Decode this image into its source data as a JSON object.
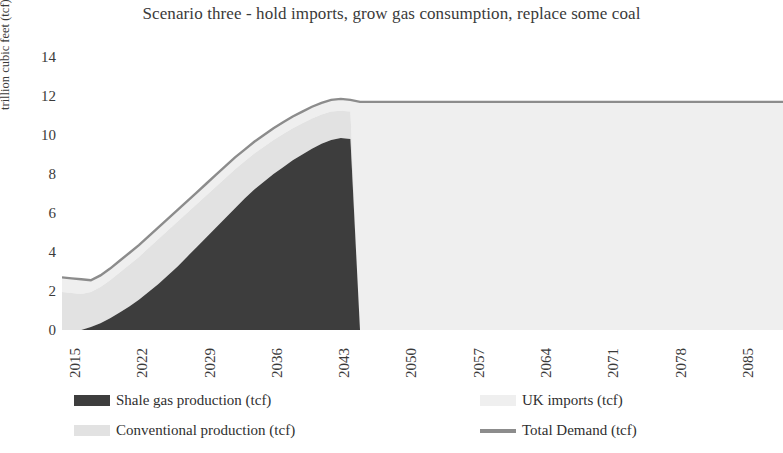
{
  "chart_data": {
    "type": "area",
    "title": "Scenario three - hold imports, grow gas consumption, replace some coal",
    "xlabel": "",
    "ylabel": "trillion cubic feet (tcf)",
    "ylim": [
      0,
      14
    ],
    "yticks": [
      0,
      2,
      4,
      6,
      8,
      10,
      12,
      14
    ],
    "xlim": [
      2015,
      2090
    ],
    "xticks": [
      2015,
      2022,
      2029,
      2036,
      2043,
      2050,
      2057,
      2064,
      2071,
      2078,
      2085
    ],
    "grid": false,
    "legend_position": "bottom",
    "stacked": true,
    "stack_order": [
      "Shale gas production (tcf)",
      "Conventional production (tcf)",
      "UK imports (tcf)"
    ],
    "colors": {
      "shale": "#3d3d3d",
      "conventional": "#e2e2e2",
      "imports": "#efefef",
      "demand_line": "#8c8c8c"
    },
    "x": [
      2015,
      2016,
      2017,
      2018,
      2019,
      2020,
      2021,
      2022,
      2023,
      2024,
      2025,
      2026,
      2027,
      2028,
      2029,
      2030,
      2031,
      2032,
      2033,
      2034,
      2035,
      2036,
      2037,
      2038,
      2039,
      2040,
      2041,
      2042,
      2043,
      2044,
      2045,
      2046,
      2047,
      2048,
      2049,
      2050,
      2055,
      2060,
      2065,
      2070,
      2075,
      2080,
      2085,
      2090
    ],
    "series": [
      {
        "name": "Shale gas production (tcf)",
        "color": "#3d3d3d",
        "values": [
          0,
          0,
          0,
          0.15,
          0.35,
          0.6,
          0.9,
          1.2,
          1.55,
          1.95,
          2.35,
          2.8,
          3.25,
          3.75,
          4.25,
          4.75,
          5.25,
          5.75,
          6.25,
          6.75,
          7.2,
          7.6,
          8.0,
          8.35,
          8.7,
          9.0,
          9.3,
          9.55,
          9.75,
          9.85,
          9.8,
          0,
          0,
          0,
          0,
          0,
          0,
          0,
          0,
          0,
          0,
          0,
          0,
          0
        ]
      },
      {
        "name": "Conventional production (tcf)",
        "color": "#e2e2e2",
        "values": [
          1.95,
          1.9,
          1.85,
          1.8,
          1.85,
          1.95,
          2.05,
          2.15,
          2.2,
          2.25,
          2.3,
          2.3,
          2.3,
          2.25,
          2.2,
          2.15,
          2.1,
          2.05,
          2.0,
          1.9,
          1.85,
          1.8,
          1.75,
          1.7,
          1.65,
          1.6,
          1.55,
          1.5,
          1.45,
          1.4,
          1.4,
          0,
          0,
          0,
          0,
          0,
          0,
          0,
          0,
          0,
          0,
          0,
          0,
          0
        ]
      },
      {
        "name": "UK imports (tcf)",
        "color": "#efefef",
        "values": [
          0.75,
          0.75,
          0.75,
          0.6,
          0.6,
          0.6,
          0.6,
          0.6,
          0.6,
          0.6,
          0.6,
          0.6,
          0.6,
          0.6,
          0.6,
          0.6,
          0.6,
          0.6,
          0.6,
          0.6,
          0.6,
          0.6,
          0.6,
          0.6,
          0.6,
          0.6,
          0.6,
          0.6,
          0.6,
          0.6,
          0.6,
          11.7,
          11.7,
          11.7,
          11.7,
          11.7,
          11.7,
          11.7,
          11.7,
          11.7,
          11.7,
          11.7,
          11.7,
          11.7
        ]
      },
      {
        "name": "Total Demand (tcf)",
        "color": "#8c8c8c",
        "type": "line",
        "values": [
          2.7,
          2.65,
          2.6,
          2.55,
          2.8,
          3.15,
          3.55,
          3.95,
          4.35,
          4.8,
          5.25,
          5.7,
          6.15,
          6.6,
          7.05,
          7.5,
          7.95,
          8.4,
          8.85,
          9.25,
          9.65,
          10.0,
          10.35,
          10.65,
          10.95,
          11.2,
          11.45,
          11.65,
          11.8,
          11.85,
          11.8,
          11.7,
          11.7,
          11.7,
          11.7,
          11.7,
          11.7,
          11.7,
          11.7,
          11.7,
          11.7,
          11.7,
          11.7,
          11.7
        ]
      }
    ]
  },
  "axis": {
    "y_title": "trillion cubic feet (tcf)",
    "y_tick_labels": [
      "14",
      "12",
      "10",
      "8",
      "6",
      "4",
      "2",
      "0"
    ],
    "x_tick_labels": [
      "2015",
      "2022",
      "2029",
      "2036",
      "2043",
      "2050",
      "2057",
      "2064",
      "2071",
      "2078",
      "2085"
    ]
  },
  "legend": {
    "items": [
      {
        "label": "Shale gas production (tcf)",
        "color": "#3d3d3d",
        "kind": "box"
      },
      {
        "label": "Conventional production (tcf)",
        "color": "#e2e2e2",
        "kind": "box"
      },
      {
        "label": "UK imports (tcf)",
        "color": "#efefef",
        "kind": "box"
      },
      {
        "label": "Total Demand (tcf)",
        "color": "#8c8c8c",
        "kind": "line"
      }
    ]
  }
}
